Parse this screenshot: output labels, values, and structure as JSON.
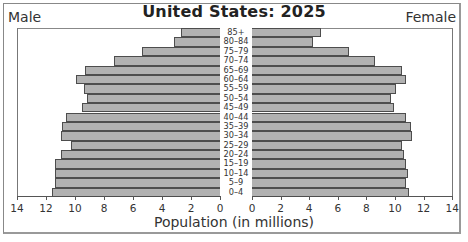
{
  "chart_data": {
    "type": "bar",
    "subtype": "population-pyramid",
    "title": "United States: 2025",
    "xlabel": "Population (in millions)",
    "ylabel": "",
    "left_series_label": "Male",
    "right_series_label": "Female",
    "xlim": [
      0,
      14
    ],
    "x_ticks": [
      0,
      2,
      4,
      6,
      8,
      10,
      12,
      14
    ],
    "grid": false,
    "categories": [
      "85+",
      "80–84",
      "75–79",
      "70–74",
      "65–69",
      "60–64",
      "55–59",
      "50–54",
      "45–49",
      "40–44",
      "35–39",
      "30–34",
      "25–29",
      "20–24",
      "15–19",
      "10–14",
      "5–9",
      "0–4"
    ],
    "series": [
      {
        "name": "Male",
        "values": [
          2.7,
          3.2,
          5.4,
          7.3,
          9.3,
          9.9,
          9.4,
          9.2,
          9.5,
          10.6,
          10.9,
          11.0,
          10.3,
          11.0,
          11.4,
          11.4,
          11.4,
          11.6
        ]
      },
      {
        "name": "Female",
        "values": [
          4.8,
          4.3,
          6.8,
          8.6,
          10.5,
          10.8,
          10.1,
          9.7,
          9.9,
          10.8,
          11.1,
          11.2,
          10.5,
          10.6,
          10.8,
          10.9,
          10.8,
          11.0
        ]
      }
    ],
    "colors": {
      "bar_fill": "#b1b1b1",
      "bar_border": "#4d4d4d"
    }
  },
  "labels": {
    "title": "United States: 2025",
    "male": "Male",
    "female": "Female",
    "xlabel": "Population (in millions)"
  }
}
